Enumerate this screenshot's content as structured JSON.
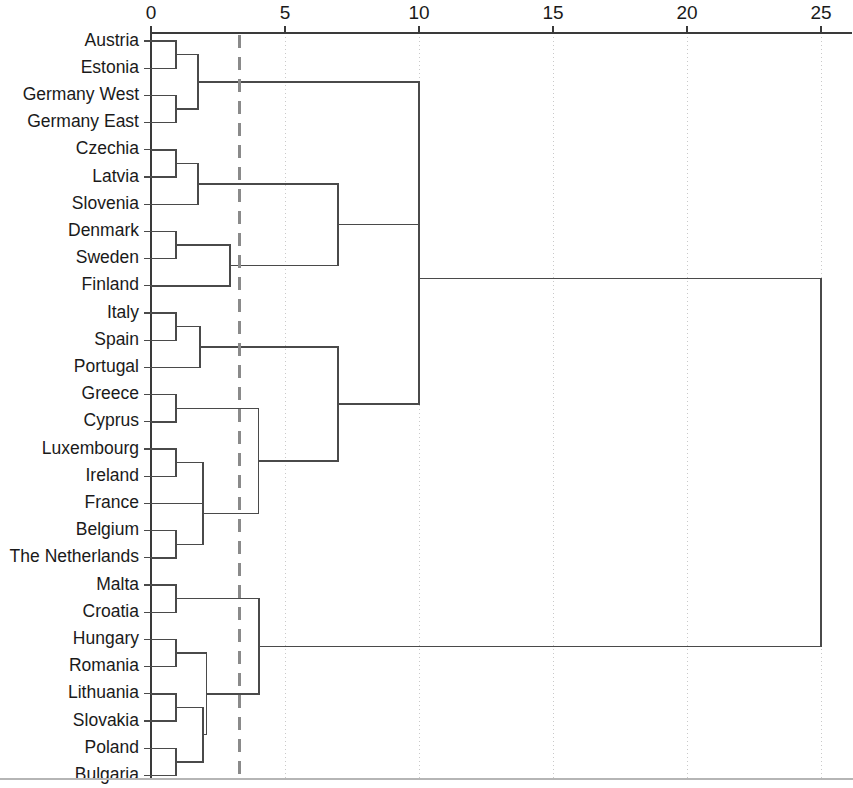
{
  "figure": {
    "type": "dendrogram",
    "orientation": "horizontal-left-root-right",
    "background_color": "#ffffff",
    "line_color": "#4a4a4a",
    "grid_color": "#c9c9c9",
    "cut_line_color": "#8a8a8a"
  },
  "axis": {
    "position": "top",
    "label": "",
    "tick_labels": [
      "0",
      "5",
      "10",
      "15",
      "20",
      "25"
    ],
    "tick_values": [
      0,
      5,
      10,
      15,
      20,
      25
    ],
    "range": [
      0,
      26.2
    ],
    "gridlines": true
  },
  "cut_line": {
    "value": 3.3,
    "style": "dashed",
    "color": "#8a8a8a"
  },
  "leaves": [
    "Austria",
    "Estonia",
    "Germany West",
    "Germany East",
    "Czechia",
    "Latvia",
    "Slovenia",
    "Denmark",
    "Sweden",
    "Finland",
    "Italy",
    "Spain",
    "Portugal",
    "Greece",
    "Cyprus",
    "Luxembourg",
    "Ireland",
    "France",
    "Belgium",
    "The Netherlands",
    "Malta",
    "Croatia",
    "Hungary",
    "Romania",
    "Lithuania",
    "Slovakia",
    "Poland",
    "Bulgaria"
  ],
  "chart_data": {
    "type": "dendrogram",
    "title": "",
    "xlabel": "",
    "ylabel": "",
    "xlim": [
      0,
      26.2
    ],
    "grid": true,
    "legend": null,
    "labels": [
      "Austria",
      "Estonia",
      "Germany West",
      "Germany East",
      "Czechia",
      "Latvia",
      "Slovenia",
      "Denmark",
      "Sweden",
      "Finland",
      "Italy",
      "Spain",
      "Portugal",
      "Greece",
      "Cyprus",
      "Luxembourg",
      "Ireland",
      "France",
      "Belgium",
      "The Netherlands",
      "Malta",
      "Croatia",
      "Hungary",
      "Romania",
      "Lithuania",
      "Slovakia",
      "Poland",
      "Bulgaria"
    ],
    "cut_threshold": 3.3,
    "merges": [
      {
        "id": 28,
        "left": "Austria",
        "right": "Estonia",
        "height": 0.93
      },
      {
        "id": 29,
        "left": "Germany West",
        "right": "Germany East",
        "height": 0.93
      },
      {
        "id": 30,
        "left": 28,
        "right": 29,
        "height": 1.75
      },
      {
        "id": 31,
        "left": "Czechia",
        "right": "Latvia",
        "height": 0.93
      },
      {
        "id": 32,
        "left": 31,
        "right": "Slovenia",
        "height": 1.75
      },
      {
        "id": 33,
        "left": "Denmark",
        "right": "Sweden",
        "height": 0.93
      },
      {
        "id": 34,
        "left": 33,
        "right": "Finland",
        "height": 2.95
      },
      {
        "id": 35,
        "left": 32,
        "right": 34,
        "height": 6.98
      },
      {
        "id": 36,
        "left": 30,
        "right": 35,
        "height": 10.0
      },
      {
        "id": 37,
        "left": "Italy",
        "right": "Spain",
        "height": 0.93
      },
      {
        "id": 38,
        "left": 37,
        "right": "Portugal",
        "height": 1.83
      },
      {
        "id": 39,
        "left": "Greece",
        "right": "Cyprus",
        "height": 0.93
      },
      {
        "id": 40,
        "left": "Luxembourg",
        "right": "Ireland",
        "height": 0.93
      },
      {
        "id": 41,
        "left": 40,
        "right": "France",
        "height": 1.94
      },
      {
        "id": 42,
        "left": "Belgium",
        "right": "The Netherlands",
        "height": 0.93
      },
      {
        "id": 43,
        "left": 41,
        "right": 42,
        "height": 1.94
      },
      {
        "id": 44,
        "left": 39,
        "right": 43,
        "height": 4.0
      },
      {
        "id": 45,
        "left": 38,
        "right": 44,
        "height": 6.98
      },
      {
        "id": 46,
        "left": 36,
        "right": 45,
        "height": 10.0
      },
      {
        "id": 47,
        "left": "Malta",
        "right": "Croatia",
        "height": 0.93
      },
      {
        "id": 48,
        "left": "Hungary",
        "right": "Romania",
        "height": 0.93
      },
      {
        "id": 49,
        "left": "Lithuania",
        "right": "Slovakia",
        "height": 0.93
      },
      {
        "id": 50,
        "left": "Poland",
        "right": "Bulgaria",
        "height": 0.93
      },
      {
        "id": 51,
        "left": 49,
        "right": 50,
        "height": 1.94
      },
      {
        "id": 52,
        "left": 48,
        "right": 51,
        "height": 2.08
      },
      {
        "id": 53,
        "left": 47,
        "right": 52,
        "height": 4.03
      },
      {
        "id": 54,
        "left": 46,
        "right": 53,
        "height": 25.0
      }
    ],
    "clusters_at_cut": [
      [
        "Austria",
        "Estonia",
        "Germany West",
        "Germany East"
      ],
      [
        "Czechia",
        "Latvia",
        "Slovenia"
      ],
      [
        "Denmark",
        "Sweden",
        "Finland"
      ],
      [
        "Italy",
        "Spain",
        "Portugal"
      ],
      [
        "Greece",
        "Cyprus",
        "Luxembourg",
        "Ireland",
        "France",
        "Belgium",
        "The Netherlands"
      ],
      [
        "Malta",
        "Croatia",
        "Hungary",
        "Romania",
        "Lithuania",
        "Slovakia",
        "Poland",
        "Bulgaria"
      ]
    ]
  }
}
